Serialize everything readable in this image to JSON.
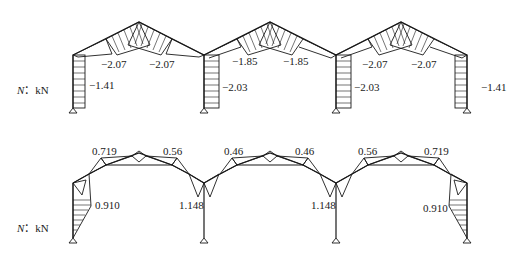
{
  "diagrams": [
    {
      "id": "top",
      "quantity_label": "N",
      "unit_label": "kN",
      "column_labels": [
        "-1.41",
        "-2.03",
        "-2.03",
        "-1.41"
      ],
      "rafter_labels": [
        "-2.07",
        "-2.07",
        "-1.85",
        "-1.85",
        "-2.07",
        "-2.07"
      ]
    },
    {
      "id": "bottom",
      "quantity_label": "N",
      "unit_label": "kN",
      "top_labels": [
        "0.719",
        "0.56",
        "0.46",
        "0.46",
        "0.56",
        "0.719"
      ],
      "side_labels": [
        "0.910",
        "1.148",
        "1.148",
        "0.910"
      ]
    }
  ]
}
